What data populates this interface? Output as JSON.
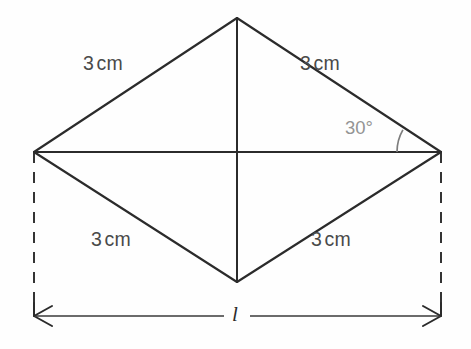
{
  "figure": {
    "background_color": "#fefefe",
    "stroke_color": "#2b2b2b",
    "label_color": "#4a4a4a",
    "angle_color": "#949494",
    "side_labels": [
      {
        "name": "top-left-side",
        "value": "3",
        "unit": "cm"
      },
      {
        "name": "top-right-side",
        "value": "3",
        "unit": "cm"
      },
      {
        "name": "bottom-left-side",
        "value": "3",
        "unit": "cm"
      },
      {
        "name": "bottom-right-side",
        "value": "3",
        "unit": "cm"
      }
    ],
    "angle": {
      "text": "30°",
      "degrees": 30,
      "vertex": "right"
    },
    "dimension": {
      "label": "l",
      "description": "overall width between left and right vertices"
    }
  },
  "geometry": {
    "type": "rhombus",
    "vertices": {
      "left": {
        "x": 34,
        "y": 152
      },
      "top": {
        "x": 237,
        "y": 18
      },
      "right": {
        "x": 441,
        "y": 152
      },
      "bottom": {
        "x": 237,
        "y": 282
      }
    },
    "diagonals": {
      "horizontal": {
        "x1": 34,
        "y1": 152,
        "x2": 441,
        "y2": 152
      },
      "vertical": {
        "x1": 237,
        "y1": 18,
        "x2": 237,
        "y2": 282
      }
    },
    "dashed_extensions": [
      {
        "name": "left-extension",
        "x1": 34,
        "y1": 152,
        "x2": 34,
        "y2": 312
      },
      {
        "name": "right-extension",
        "x1": 441,
        "y1": 152,
        "x2": 441,
        "y2": 312
      }
    ],
    "dimension_line": {
      "x1": 34,
      "y1": 316,
      "x2": 441,
      "y2": 316
    },
    "angle_arc": {
      "cx": 441,
      "cy": 152,
      "radius": 44,
      "start_deg": 180,
      "end_deg": 210
    }
  }
}
